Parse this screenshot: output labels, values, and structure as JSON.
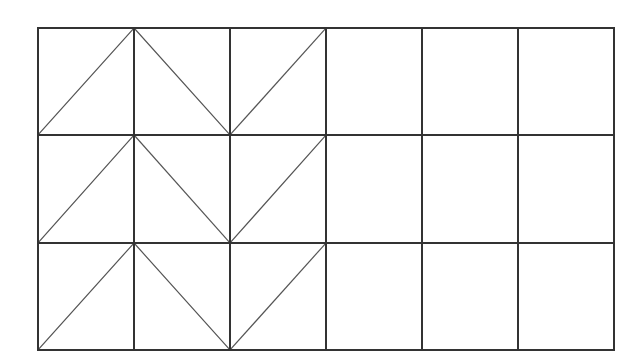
{
  "diagram": {
    "type": "grid-with-diagonals",
    "origin": {
      "x": 38,
      "y": 28
    },
    "size": {
      "width": 576,
      "height": 322
    },
    "rows": 3,
    "cols": 6,
    "col_lines_x": [
      38,
      134,
      230,
      326,
      422,
      518,
      614
    ],
    "row_lines_y": [
      28,
      135,
      243,
      350
    ],
    "colors": {
      "background": "#ffffff",
      "grid_line": "#333333",
      "diagonal_line": "#555555"
    },
    "grid_stroke_width": 2,
    "diagonal_stroke_width": 1.2,
    "cells": [
      [
        "/",
        "\\",
        "/",
        "",
        "",
        ""
      ],
      [
        "/",
        "\\",
        "/",
        "",
        "",
        ""
      ],
      [
        "/",
        "\\",
        "/",
        "",
        "",
        ""
      ]
    ]
  }
}
